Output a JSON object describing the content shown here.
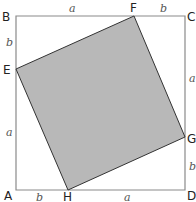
{
  "diagram": {
    "colors": {
      "outer_stroke": "#8a8a8a",
      "inner_fill": "#b8b8b8",
      "inner_stroke": "#333333"
    },
    "outer_square": {
      "points": "16,16 185,16 185,190 16,190"
    },
    "inner_square": {
      "points": "134,16 185,137 68,190 16,69"
    },
    "vertices": {
      "A": "A",
      "B": "B",
      "C": "C",
      "D": "D",
      "E": "E",
      "F": "F",
      "G": "G",
      "H": "H"
    },
    "side_labels": {
      "top_a": "a",
      "top_b": "b",
      "left_b": "b",
      "left_a": "a",
      "right_a": "a",
      "right_b": "b",
      "bottom_b": "b",
      "bottom_a": "a"
    }
  }
}
